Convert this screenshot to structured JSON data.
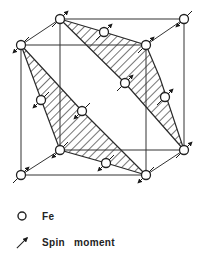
{
  "figure": {
    "atoms": [
      {
        "x": 60,
        "y": 19,
        "spin": "up"
      },
      {
        "x": 184,
        "y": 19,
        "spin": "down"
      },
      {
        "x": 21,
        "y": 45,
        "spin": "down"
      },
      {
        "x": 146,
        "y": 45,
        "spin": "up"
      },
      {
        "x": 104,
        "y": 32,
        "spin": "up"
      },
      {
        "x": 165,
        "y": 97,
        "spin": "up"
      },
      {
        "x": 125,
        "y": 83,
        "spin": "up"
      },
      {
        "x": 41,
        "y": 100,
        "spin": "down"
      },
      {
        "x": 82,
        "y": 111,
        "spin": "down"
      },
      {
        "x": 60,
        "y": 150,
        "spin": "down"
      },
      {
        "x": 184,
        "y": 150,
        "spin": "up"
      },
      {
        "x": 21,
        "y": 175,
        "spin": "up"
      },
      {
        "x": 146,
        "y": 175,
        "spin": "down"
      },
      {
        "x": 106,
        "y": 163,
        "spin": "down"
      }
    ],
    "colors": {
      "line": "#2a2a2a",
      "atom_fill": "#ffffff",
      "background": "#ffffff"
    }
  },
  "legend": {
    "items": [
      {
        "symbol": "circle-icon",
        "label": "Fe"
      },
      {
        "symbol": "arrow-icon",
        "label": "Spin   moment"
      }
    ]
  }
}
